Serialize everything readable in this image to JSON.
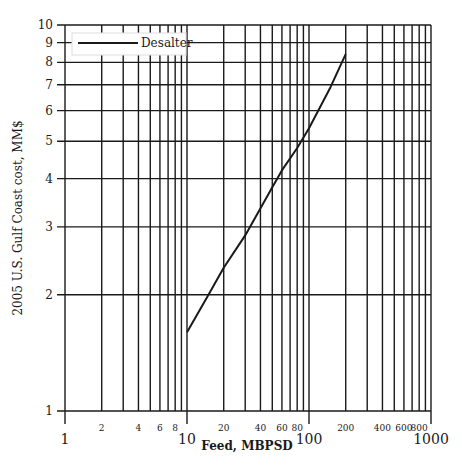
{
  "chart_data": {
    "type": "line",
    "title": "",
    "xlabel": "Feed, MBPSD",
    "ylabel": "2005 U.S. Gulf Coast cost, MM$",
    "xscale": "log",
    "yscale": "log",
    "xlim": [
      1,
      1000
    ],
    "ylim": [
      1,
      10
    ],
    "grid": true,
    "legend_position": "upper left",
    "x_major_ticks": [
      {
        "value": 1,
        "label": "1"
      },
      {
        "value": 10,
        "label": "10"
      },
      {
        "value": 100,
        "label": "100"
      },
      {
        "value": 1000,
        "label": "1000"
      }
    ],
    "x_minor_ticks": [
      {
        "value": 2,
        "label": "2"
      },
      {
        "value": 3,
        "label": ""
      },
      {
        "value": 4,
        "label": "4"
      },
      {
        "value": 5,
        "label": ""
      },
      {
        "value": 6,
        "label": "6"
      },
      {
        "value": 7,
        "label": ""
      },
      {
        "value": 8,
        "label": "8"
      },
      {
        "value": 9,
        "label": ""
      },
      {
        "value": 20,
        "label": "20"
      },
      {
        "value": 30,
        "label": ""
      },
      {
        "value": 40,
        "label": "40"
      },
      {
        "value": 50,
        "label": ""
      },
      {
        "value": 60,
        "label": "60"
      },
      {
        "value": 70,
        "label": ""
      },
      {
        "value": 80,
        "label": "80"
      },
      {
        "value": 90,
        "label": ""
      },
      {
        "value": 200,
        "label": "200"
      },
      {
        "value": 300,
        "label": ""
      },
      {
        "value": 400,
        "label": "400"
      },
      {
        "value": 500,
        "label": ""
      },
      {
        "value": 600,
        "label": "600"
      },
      {
        "value": 700,
        "label": ""
      },
      {
        "value": 800,
        "label": "800"
      },
      {
        "value": 900,
        "label": ""
      }
    ],
    "y_ticks": [
      {
        "value": 1,
        "label": "1"
      },
      {
        "value": 2,
        "label": "2"
      },
      {
        "value": 3,
        "label": "3"
      },
      {
        "value": 4,
        "label": "4"
      },
      {
        "value": 5,
        "label": "5"
      },
      {
        "value": 6,
        "label": "6"
      },
      {
        "value": 7,
        "label": "7"
      },
      {
        "value": 8,
        "label": "8"
      },
      {
        "value": 9,
        "label": "9"
      },
      {
        "value": 10,
        "label": "10"
      }
    ],
    "series": [
      {
        "name": "Desalter",
        "color": "#1a1a1a",
        "x": [
          10,
          15,
          20,
          30,
          40,
          50,
          60,
          80,
          100,
          150,
          200
        ],
        "y": [
          1.6,
          2.0,
          2.35,
          2.85,
          3.35,
          3.8,
          4.2,
          4.8,
          5.4,
          6.9,
          8.4
        ]
      }
    ]
  }
}
